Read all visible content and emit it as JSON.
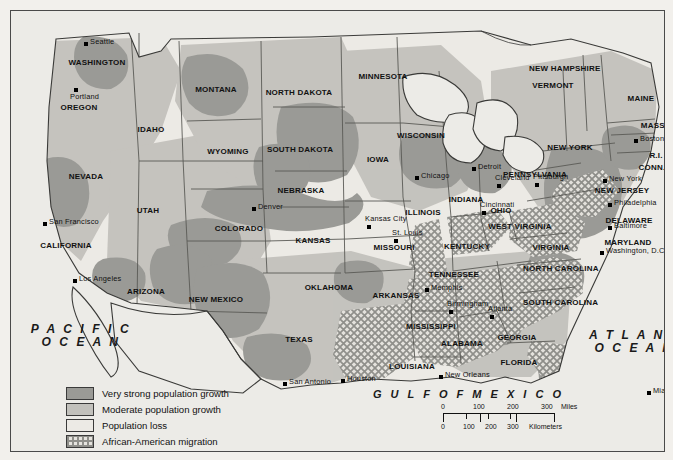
{
  "map": {
    "title": "United States population change map",
    "oceans": [
      {
        "name": "pacific-ocean",
        "line1": "P A C I F I C",
        "line2": "O C E A N"
      },
      {
        "name": "atlantic-ocean",
        "line1": "A T L A N T I C",
        "line2": "O C E A N"
      }
    ],
    "gulf": "G U L F   O F   M E X I C O",
    "states": [
      {
        "label": "WASHINGTON",
        "x": 86,
        "y": 48,
        "size": "sm"
      },
      {
        "label": "OREGON",
        "x": 68,
        "y": 93,
        "size": "sm"
      },
      {
        "label": "IDAHO",
        "x": 140,
        "y": 115,
        "size": "sm"
      },
      {
        "label": "MONTANA",
        "x": 205,
        "y": 75,
        "size": "sm"
      },
      {
        "label": "WYOMING",
        "x": 217,
        "y": 137,
        "size": "sm"
      },
      {
        "label": "NEVADA",
        "x": 75,
        "y": 162,
        "size": "sm"
      },
      {
        "label": "UTAH",
        "x": 137,
        "y": 196,
        "size": "sm"
      },
      {
        "label": "CALIFORNIA",
        "x": 55,
        "y": 231,
        "size": "sm"
      },
      {
        "label": "ARIZONA",
        "x": 135,
        "y": 277,
        "size": "sm"
      },
      {
        "label": "NEW MEXICO",
        "x": 205,
        "y": 285,
        "size": "sm"
      },
      {
        "label": "COLORADO",
        "x": 228,
        "y": 214,
        "size": "sm"
      },
      {
        "label": "NORTH DAKOTA",
        "x": 288,
        "y": 78,
        "size": "sm"
      },
      {
        "label": "SOUTH DAKOTA",
        "x": 289,
        "y": 135,
        "size": "sm"
      },
      {
        "label": "NEBRASKA",
        "x": 290,
        "y": 176,
        "size": "sm"
      },
      {
        "label": "KANSAS",
        "x": 302,
        "y": 226,
        "size": "sm"
      },
      {
        "label": "OKLAHOMA",
        "x": 318,
        "y": 273,
        "size": "sm"
      },
      {
        "label": "TEXAS",
        "x": 288,
        "y": 325,
        "size": "sm"
      },
      {
        "label": "MINNESOTA",
        "x": 372,
        "y": 62,
        "size": "sm"
      },
      {
        "label": "IOWA",
        "x": 367,
        "y": 145,
        "size": "sm"
      },
      {
        "label": "MISSOURI",
        "x": 383,
        "y": 233,
        "size": "sm"
      },
      {
        "label": "ARKANSAS",
        "x": 385,
        "y": 281,
        "size": "sm"
      },
      {
        "label": "LOUISIANA",
        "x": 401,
        "y": 352,
        "size": "sm"
      },
      {
        "label": "WISCONSIN",
        "x": 410,
        "y": 121,
        "size": "sm"
      },
      {
        "label": "ILLINOIS",
        "x": 412,
        "y": 198,
        "size": "sm"
      },
      {
        "label": "MISSISSIPPI",
        "x": 420,
        "y": 312,
        "size": "sm"
      },
      {
        "label": "ALABAMA",
        "x": 451,
        "y": 329,
        "size": "sm"
      },
      {
        "label": "TENNESSEE",
        "x": 443,
        "y": 260,
        "size": "sm"
      },
      {
        "label": "KENTUCKY",
        "x": 456,
        "y": 232,
        "size": "sm"
      },
      {
        "label": "INDIANA",
        "x": 455,
        "y": 185,
        "size": "sm"
      },
      {
        "label": "OHIO",
        "x": 490,
        "y": 196,
        "size": "sm"
      },
      {
        "label": "WEST VIRGINIA",
        "x": 509,
        "y": 212,
        "size": "sm"
      },
      {
        "label": "VIRGINIA",
        "x": 540,
        "y": 233,
        "size": "sm"
      },
      {
        "label": "NORTH CAROLINA",
        "x": 546,
        "y": 254,
        "size": "sm"
      },
      {
        "label": "SOUTH CAROLINA",
        "x": 546,
        "y": 288,
        "size": "sm"
      },
      {
        "label": "GEORGIA",
        "x": 506,
        "y": 323,
        "size": "sm"
      },
      {
        "label": "FLORIDA",
        "x": 508,
        "y": 348,
        "size": "sm"
      },
      {
        "label": "PENNSYLVANIA",
        "x": 524,
        "y": 160,
        "size": "sm"
      },
      {
        "label": "NEW YORK",
        "x": 559,
        "y": 133,
        "size": "sm"
      },
      {
        "label": "MAINE",
        "x": 630,
        "y": 84,
        "size": "sm"
      },
      {
        "label": "VERMONT",
        "x": 542,
        "y": 71,
        "size": "sm"
      },
      {
        "label": "NEW HAMPSHIRE",
        "x": 552,
        "y": 54,
        "size": "sm"
      },
      {
        "label": "MASS.",
        "x": 643,
        "y": 111,
        "size": "sm"
      },
      {
        "label": "R.I.",
        "x": 645,
        "y": 141,
        "size": "sm"
      },
      {
        "label": "CONN.",
        "x": 641,
        "y": 153,
        "size": "sm"
      },
      {
        "label": "NEW JERSEY",
        "x": 611,
        "y": 176,
        "size": "sm"
      },
      {
        "label": "DELAWARE",
        "x": 618,
        "y": 206,
        "size": "sm"
      },
      {
        "label": "MARYLAND",
        "x": 617,
        "y": 228,
        "size": "sm"
      }
    ],
    "cities": [
      {
        "label": "Seattle",
        "dx": 73,
        "dy": 31,
        "anchor": "left"
      },
      {
        "label": "Portland",
        "dx": 63,
        "dy": 77,
        "anchor": "below"
      },
      {
        "label": "San Francisco",
        "dx": 32,
        "dy": 211,
        "anchor": "left"
      },
      {
        "label": "Los Angeles",
        "dx": 62,
        "dy": 268,
        "anchor": "left"
      },
      {
        "label": "Denver",
        "dx": 241,
        "dy": 196,
        "anchor": "left"
      },
      {
        "label": "Kansas City",
        "dx": 356,
        "dy": 214,
        "anchor": "above"
      },
      {
        "label": "St. Louis",
        "dx": 383,
        "dy": 228,
        "anchor": "above"
      },
      {
        "label": "Chicago",
        "dx": 404,
        "dy": 165,
        "anchor": "left"
      },
      {
        "label": "Detroit",
        "dx": 461,
        "dy": 156,
        "anchor": "left"
      },
      {
        "label": "Cleveland",
        "dx": 486,
        "dy": 173,
        "anchor": "above"
      },
      {
        "label": "Cincinnati",
        "dx": 471,
        "dy": 200,
        "anchor": "above"
      },
      {
        "label": "Pittsburgh",
        "dx": 524,
        "dy": 172,
        "anchor": "above"
      },
      {
        "label": "New York",
        "dx": 592,
        "dy": 168,
        "anchor": "left"
      },
      {
        "label": "Philadelphia",
        "dx": 597,
        "dy": 192,
        "anchor": "left"
      },
      {
        "label": "Baltimore",
        "dx": 597,
        "dy": 215,
        "anchor": "left"
      },
      {
        "label": "Washington, D.C.",
        "dx": 589,
        "dy": 240,
        "anchor": "left"
      },
      {
        "label": "Boston",
        "dx": 623,
        "dy": 128,
        "anchor": "left"
      },
      {
        "label": "Memphis",
        "dx": 414,
        "dy": 277,
        "anchor": "left"
      },
      {
        "label": "Birmingham",
        "dx": 438,
        "dy": 299,
        "anchor": "above"
      },
      {
        "label": "Atlanta",
        "dx": 479,
        "dy": 304,
        "anchor": "above"
      },
      {
        "label": "New Orleans",
        "dx": 428,
        "dy": 364,
        "anchor": "left"
      },
      {
        "label": "Houston",
        "dx": 330,
        "dy": 368,
        "anchor": "left"
      },
      {
        "label": "San Antonio",
        "dx": 272,
        "dy": 371,
        "anchor": "left"
      },
      {
        "label": "Miami",
        "dx": 636,
        "dy": 380,
        "anchor": "left"
      }
    ],
    "legend": {
      "name": "map-legend",
      "items": [
        {
          "swatch": "s1",
          "label": "Very strong population growth",
          "color": "#9a9a96"
        },
        {
          "swatch": "s2",
          "label": "Moderate population growth",
          "color": "#c2c1bc"
        },
        {
          "swatch": "s3",
          "label": "Population loss",
          "color": "#eceae5"
        },
        {
          "swatch": "s4",
          "label": "African-American migration",
          "color": "#8f8f8a"
        }
      ]
    },
    "scale": {
      "name": "scale-bar",
      "miles": {
        "ticks": [
          "0",
          "100",
          "200",
          "300"
        ],
        "unit": "Miles"
      },
      "kilometers": {
        "ticks": [
          "0",
          "100",
          "200",
          "300"
        ],
        "unit": "Kilometers"
      }
    }
  }
}
